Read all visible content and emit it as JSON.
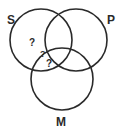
{
  "diagram": {
    "type": "venn",
    "sets": [
      {
        "id": "S",
        "label": "S",
        "cx": 41,
        "cy": 40,
        "r": 31
      },
      {
        "id": "P",
        "label": "P",
        "cx": 76,
        "cy": 40,
        "r": 31
      },
      {
        "id": "M",
        "label": "M",
        "cx": 62,
        "cy": 79,
        "r": 31
      }
    ],
    "labels": {
      "S": "S",
      "P": "P",
      "M": "M"
    },
    "markers": [
      {
        "text": "?",
        "region": "S only"
      },
      {
        "text": "?",
        "region": "S ∩ P ∩ M boundary"
      },
      {
        "text": "?",
        "region": "S ∩ M"
      }
    ],
    "stroke_color": "#2a2a2a",
    "background": "#ffffff"
  }
}
